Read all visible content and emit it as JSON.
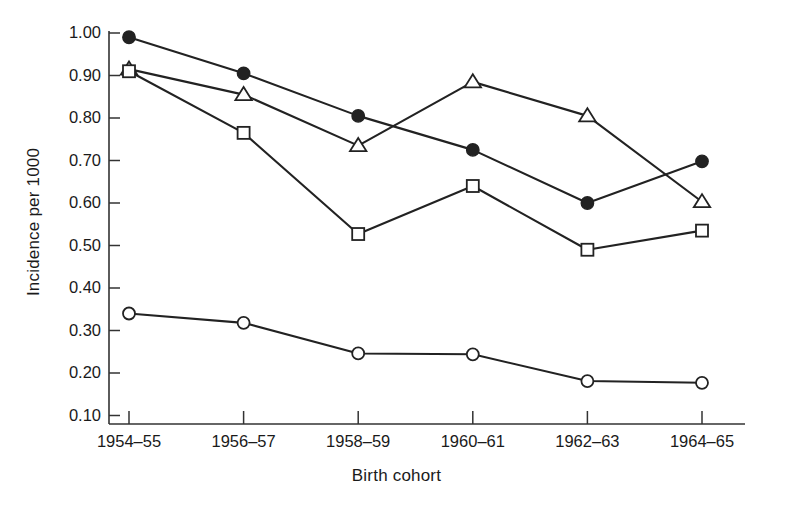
{
  "chart_data": {
    "type": "line",
    "title": "",
    "subtitle": "",
    "xlabel": "Birth cohort",
    "ylabel": "Incidence per 1000",
    "categories": [
      "1954–55",
      "1956–57",
      "1958–59",
      "1960–61",
      "1962–63",
      "1964–65"
    ],
    "ytick_labels": [
      "1.00",
      "0.90",
      "0.80",
      "0.70",
      "0.60",
      "0.50",
      "0.40",
      "0.30",
      "0.20",
      "0.10"
    ],
    "ytick_values": [
      1.0,
      0.9,
      0.8,
      0.7,
      0.6,
      0.5,
      0.4,
      0.3,
      0.2,
      0.1
    ],
    "ylim": [
      0.07,
      1.02
    ],
    "grid": false,
    "legend": "none",
    "axis_color": "#333333",
    "line_color": "#222222",
    "series": [
      {
        "name": "filled-circle",
        "marker": "filled-circle",
        "color": "#222222",
        "values": [
          0.99,
          0.905,
          0.805,
          0.725,
          0.6,
          0.698
        ]
      },
      {
        "name": "open-triangle",
        "marker": "open-triangle",
        "color": "#222222",
        "values": [
          0.915,
          0.855,
          0.735,
          0.885,
          0.805,
          0.603
        ]
      },
      {
        "name": "open-square",
        "marker": "open-square",
        "color": "#222222",
        "values": [
          0.91,
          0.765,
          0.527,
          0.64,
          0.49,
          0.535
        ]
      },
      {
        "name": "open-circle",
        "marker": "open-circle",
        "color": "#222222",
        "values": [
          0.34,
          0.318,
          0.246,
          0.244,
          0.181,
          0.177
        ]
      }
    ]
  }
}
